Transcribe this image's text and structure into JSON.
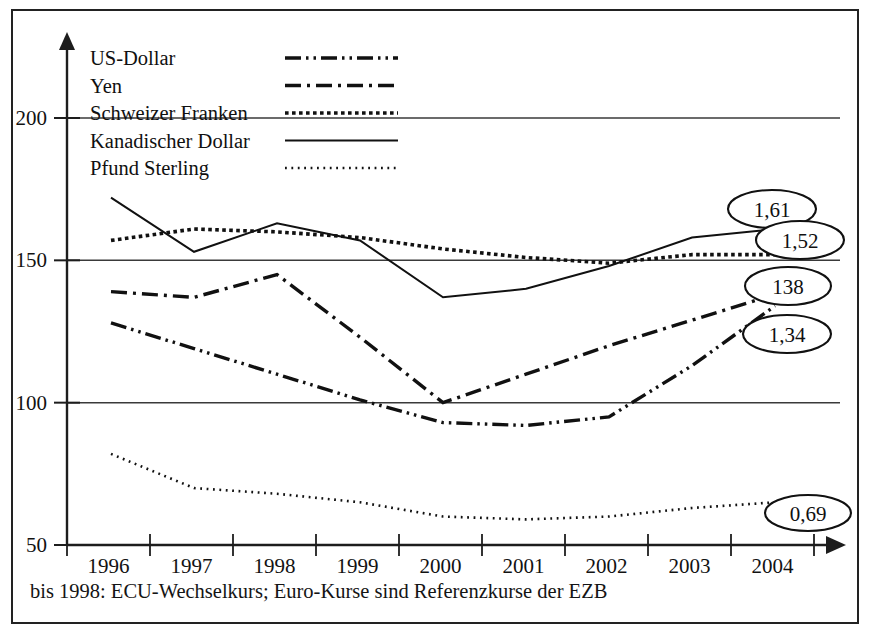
{
  "footnote": "bis 1998: ECU-Wechselkurs; Euro-Kurse sind Referenzkurse der EZB",
  "legend": {
    "position": "top-left-inside",
    "entries": [
      {
        "label": "US-Dollar",
        "dash": "16,5,2.5,5,2.5,5",
        "width": 3.4
      },
      {
        "label": "Yen",
        "dash": "16,6,3,6",
        "width": 3.4
      },
      {
        "label": "Schweizer Franken",
        "dash": "3.6,3.4",
        "width": 3.6
      },
      {
        "label": "Kanadischer Dollar",
        "dash": "",
        "width": 2.0
      },
      {
        "label": "Pfund Sterling",
        "dash": "1.8,4.6",
        "width": 2.6
      }
    ]
  },
  "callouts": [
    {
      "text": "1,61",
      "cx": 772,
      "cy": 209,
      "rx": 44,
      "ry": 19
    },
    {
      "text": "1,52",
      "cx": 800,
      "cy": 240,
      "rx": 44,
      "ry": 19
    },
    {
      "text": "138",
      "cx": 788,
      "cy": 286,
      "rx": 43,
      "ry": 19
    },
    {
      "text": "1,34",
      "cx": 787,
      "cy": 334,
      "rx": 44,
      "ry": 19
    },
    {
      "text": "0,69",
      "cx": 808,
      "cy": 513,
      "rx": 43,
      "ry": 18
    }
  ],
  "chart_data": {
    "type": "line",
    "title": "",
    "subtitle": "",
    "xlabel": "",
    "ylabel": "",
    "x": [
      1996,
      1997,
      1998,
      1999,
      2000,
      2001,
      2002,
      2003,
      2004
    ],
    "categories": [
      "1996",
      "1997",
      "1998",
      "1999",
      "2000",
      "2001",
      "2002",
      "2003",
      "2004"
    ],
    "xlim": [
      1995.5,
      2004.5
    ],
    "ylim": [
      50,
      215
    ],
    "yticks": [
      50,
      100,
      150,
      200
    ],
    "ytick_labels": [
      "50",
      "100",
      "150",
      "200"
    ],
    "gridlines": [
      100,
      150,
      200
    ],
    "grid": true,
    "series": [
      {
        "name": "US-Dollar",
        "dash": "16,5,2.5,5,2.5,5",
        "width": 3.4,
        "values": [
          128,
          119,
          110,
          101,
          93,
          92,
          95,
          113,
          134
        ],
        "end_label": "1,34"
      },
      {
        "name": "Yen",
        "dash": "16,6,3,6",
        "width": 3.4,
        "values": [
          139,
          137,
          145,
          123,
          100,
          110,
          120,
          129,
          138
        ],
        "end_label": "138"
      },
      {
        "name": "Schweizer Franken",
        "dash": "3.6,3.4",
        "width": 3.6,
        "values": [
          157,
          161,
          160,
          158,
          154,
          151,
          149,
          152,
          152
        ],
        "end_label": "1,52"
      },
      {
        "name": "Kanadischer Dollar",
        "dash": "",
        "width": 2.0,
        "values": [
          172,
          153,
          163,
          157,
          137,
          140,
          148,
          158,
          161
        ],
        "end_label": "1,61"
      },
      {
        "name": "Pfund Sterling",
        "dash": "1.8,4.6",
        "width": 2.6,
        "values": [
          82,
          70,
          68,
          65,
          60,
          59,
          60,
          63,
          65
        ],
        "end_label": "0,69"
      }
    ]
  }
}
